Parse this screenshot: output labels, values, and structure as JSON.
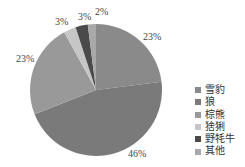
{
  "chart_data": {
    "type": "pie",
    "title": "",
    "categories": [
      "雪豹",
      "狼",
      "棕熊",
      "猞猁",
      "野牦牛",
      "其他"
    ],
    "values": [
      23,
      46,
      23,
      3,
      3,
      2
    ],
    "labels": [
      "23%",
      "46%",
      "23%",
      "3%",
      "3%",
      "2%"
    ],
    "colors": [
      "#8a8a8a",
      "#7a7a7a",
      "#999999",
      "#c6c6c6",
      "#4a4a4a",
      "#a8a8a8"
    ],
    "start_angle": "12 o'clock",
    "direction": "clockwise",
    "legend_position": "right"
  }
}
